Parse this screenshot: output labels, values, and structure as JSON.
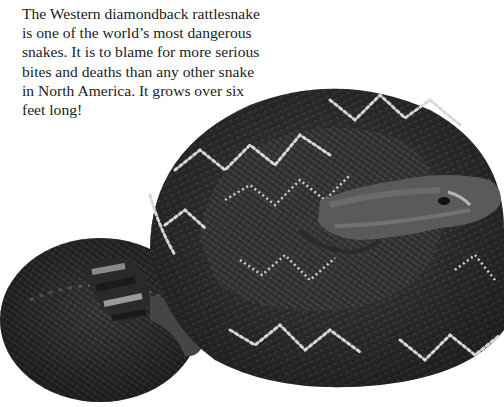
{
  "caption": {
    "text": "The Western diamondback rattlesnake is one of the world’s most dangerous snakes. It is to blame for more serious bites and deaths than any other snake in North America. It grows over six feet long!"
  },
  "photo": {
    "subject": "Western diamondback rattlesnake, coiled",
    "tone": "grayscale",
    "colors": {
      "background": "#ffffff",
      "body_dark": "#2b2b2b",
      "body_mid": "#4a4a4a",
      "diamond_light": "#d8d8d8",
      "head": "#5a5a5a"
    }
  }
}
